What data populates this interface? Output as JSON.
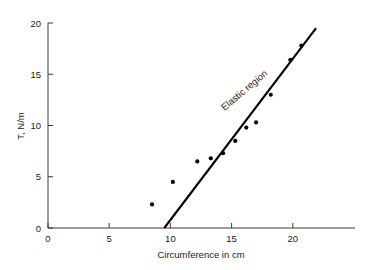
{
  "chart_data": {
    "type": "scatter",
    "title": "",
    "xlabel": "Circumference in cm",
    "ylabel": "T, N/m",
    "xlim": [
      0,
      24
    ],
    "ylim": [
      0,
      20
    ],
    "xticks": [
      0,
      5,
      10,
      15,
      20
    ],
    "yticks": [
      0,
      5,
      10,
      15,
      20
    ],
    "xtick_labels": [
      "0",
      "5",
      "10",
      "15",
      "20"
    ],
    "ytick_labels": [
      "0",
      "5",
      "10",
      "15",
      "20"
    ],
    "grid": false,
    "legend": "none",
    "points": [
      {
        "x": 8.5,
        "y": 2.3
      },
      {
        "x": 10.2,
        "y": 4.5
      },
      {
        "x": 12.2,
        "y": 6.5
      },
      {
        "x": 13.3,
        "y": 6.8
      },
      {
        "x": 14.3,
        "y": 7.3
      },
      {
        "x": 15.3,
        "y": 8.5
      },
      {
        "x": 16.2,
        "y": 9.8
      },
      {
        "x": 17.0,
        "y": 10.3
      },
      {
        "x": 18.2,
        "y": 13.0
      },
      {
        "x": 19.8,
        "y": 16.4
      },
      {
        "x": 20.7,
        "y": 17.8
      }
    ],
    "fit_line": {
      "label": "Elastic region",
      "x_start": 9.5,
      "y_start": 0.0,
      "x_end": 21.9,
      "y_end": 19.5
    },
    "annotations": [
      {
        "text": "Elastic region",
        "x": 16.2,
        "y": 13.2,
        "rotation": -40
      }
    ],
    "colors": {
      "point": "#000000",
      "line": "#000000",
      "axis": "#3a3a3a",
      "text": "#1a1a1a",
      "background": "#ffffff"
    }
  }
}
